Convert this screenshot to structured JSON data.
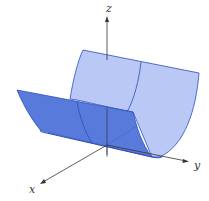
{
  "figure": {
    "axes": {
      "x_label": "x",
      "y_label": "y",
      "z_label": "z"
    },
    "colors": {
      "front_surface": "#4a6fd8",
      "back_surface": "#b9c8f4",
      "edge": "#2d4fb8",
      "axis": "#333333"
    }
  }
}
